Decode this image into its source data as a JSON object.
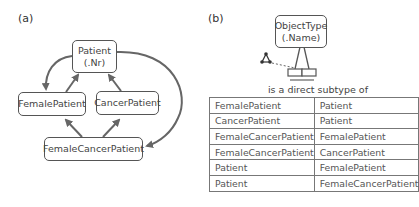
{
  "panel_a": {
    "label": "(a)",
    "nodes": {
      "patient": {
        "line1": "Patient",
        "line2": "(.Nr)"
      },
      "female_patient": "FemalePatient",
      "cancer_patient": "CancerPatient",
      "female_cancer_patient": "FemaleCancerPatient"
    }
  },
  "panel_b": {
    "label": "(b)",
    "object_type": {
      "line1": "ObjectType",
      "line2": "(.Name)"
    },
    "fact_reading": "is a direct subtype of",
    "table": {
      "rows": [
        [
          "FemalePatient",
          "Patient"
        ],
        [
          "CancerPatient",
          "Patient"
        ],
        [
          "FemaleCancerPatient",
          "FemalePatient"
        ],
        [
          "FemaleCancerPatient",
          "CancerPatient"
        ],
        [
          "Patient",
          "FemalePatient"
        ],
        [
          "Patient",
          "FemaleCancerPatient"
        ]
      ]
    }
  },
  "colors": {
    "stroke": "#555555",
    "arrow": "#666666"
  }
}
